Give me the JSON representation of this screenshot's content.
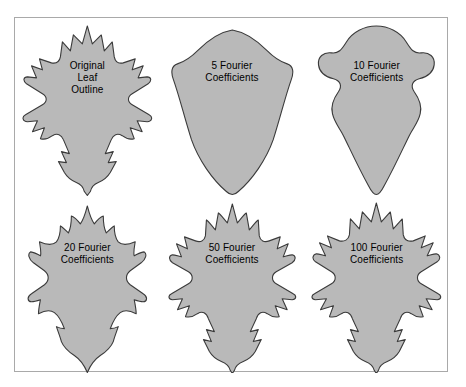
{
  "figure": {
    "frame_border_color": "#a9a9a9",
    "background_color": "#ffffff",
    "shape_fill_color": "#b9b9b9",
    "shape_outline_color": "#3a3a3a",
    "caption_text_color": "#000000",
    "grid": {
      "rows": 2,
      "columns": 3
    }
  },
  "panels": [
    {
      "id": "original-leaf-outline",
      "caption_lines": [
        "Original",
        "Leaf",
        "Outline"
      ],
      "coefficients": null,
      "shape": "oak-leaf-original"
    },
    {
      "id": "5-fourier-coefficients",
      "caption_lines": [
        "5 Fourier",
        "Coefficients"
      ],
      "coefficients": 5,
      "shape": "shield-smooth"
    },
    {
      "id": "10-fourier-coefficients",
      "caption_lines": [
        "10 Fourier",
        "Coefficients"
      ],
      "coefficients": 10,
      "shape": "blobby-lobed"
    },
    {
      "id": "20-fourier-coefficients",
      "caption_lines": [
        "20 Fourier",
        "Coefficients"
      ],
      "coefficients": 20,
      "shape": "oak-leaf-coarse"
    },
    {
      "id": "50-fourier-coefficients",
      "caption_lines": [
        "50 Fourier",
        "Coefficients"
      ],
      "coefficients": 50,
      "shape": "oak-leaf-fine"
    },
    {
      "id": "100-fourier-coefficients",
      "caption_lines": [
        "100 Fourier",
        "Coefficients"
      ],
      "coefficients": 100,
      "shape": "oak-leaf-finest"
    }
  ]
}
